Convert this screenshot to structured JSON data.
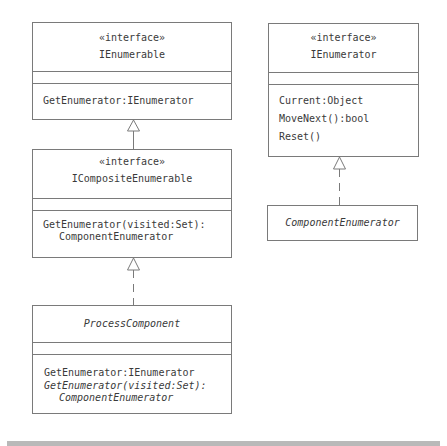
{
  "diagram": {
    "type": "uml-class-diagram",
    "classes": {
      "ienumerable": {
        "stereotype": "«interface»",
        "name": "IEnumerable",
        "attributes": [],
        "operations": [
          "GetEnumerator:IEnumerator"
        ]
      },
      "icompositeenumerable": {
        "stereotype": "«interface»",
        "name": "ICompositeEnumerable",
        "attributes": [],
        "operations": [
          "GetEnumerator(visited:Set):",
          "ComponentEnumerator"
        ]
      },
      "processcomponent": {
        "name": "ProcessComponent",
        "abstract": true,
        "attributes": [],
        "operations": [
          "GetEnumerator:IEnumerator",
          "GetEnumerator(visited:Set):",
          "ComponentEnumerator"
        ]
      },
      "ienumerator": {
        "stereotype": "«interface»",
        "name": "IEnumerator",
        "attributes": [],
        "operations": [
          "Current:Object",
          "MoveNext():bool",
          "Reset()"
        ]
      },
      "componentenumerator": {
        "name": "ComponentEnumerator",
        "abstract": true
      }
    },
    "relationships": [
      {
        "from": "ICompositeEnumerable",
        "to": "IEnumerable",
        "kind": "generalization"
      },
      {
        "from": "ProcessComponent",
        "to": "ICompositeEnumerable",
        "kind": "realization"
      },
      {
        "from": "ComponentEnumerator",
        "to": "IEnumerator",
        "kind": "realization"
      }
    ],
    "colors": {
      "line": "#7a7a7a",
      "text": "#3a3a3a",
      "footer_bar": "#b9b9b9"
    }
  }
}
